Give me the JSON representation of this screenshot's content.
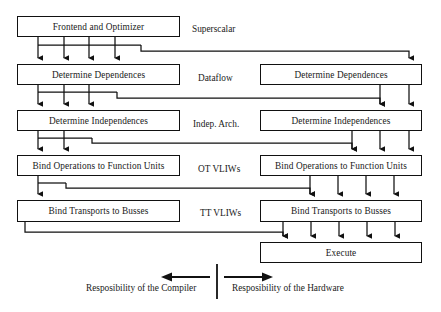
{
  "diagram": {
    "stroke_color": "#111111",
    "background_color": "#ffffff",
    "compiler_column": {
      "boxes": [
        {
          "label": "Frontend and Optimizer"
        },
        {
          "label": "Determine Dependences"
        },
        {
          "label": "Determine Independences"
        },
        {
          "label": "Bind Operations to Function Units"
        },
        {
          "label": "Bind Transports to Busses"
        }
      ]
    },
    "hardware_column": {
      "boxes": [
        {
          "label": "Determine Dependences"
        },
        {
          "label": "Determine Independences"
        },
        {
          "label": "Bind Operations to Function Units"
        },
        {
          "label": "Bind Transports to Busses"
        },
        {
          "label": "Execute"
        }
      ]
    },
    "architecture_labels": [
      {
        "label": "Superscalar"
      },
      {
        "label": "Dataflow"
      },
      {
        "label": "Indep. Arch."
      },
      {
        "label": "OT VLIWs"
      },
      {
        "label": "TT VLIWs"
      }
    ],
    "footer": {
      "left_label": "Resposibility of the Compiler",
      "right_label": "Resposibility of the Hardware"
    }
  }
}
